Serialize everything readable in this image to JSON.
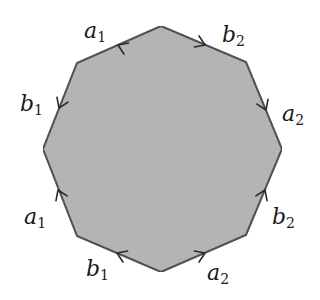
{
  "diagram": {
    "title": "",
    "type": "fundamental polygon (octagon)",
    "colors": {
      "fill": "#b4b4b4",
      "stroke": "#3a3a3a",
      "label": "#1a1a1a",
      "background": "#ffffff"
    },
    "vertices": [
      {
        "id": "top",
        "x": 161,
        "y": 26
      },
      {
        "id": "top-right",
        "x": 246,
        "y": 62
      },
      {
        "id": "right",
        "x": 282,
        "y": 149
      },
      {
        "id": "bottom-right",
        "x": 246,
        "y": 235
      },
      {
        "id": "bottom",
        "x": 161,
        "y": 272
      },
      {
        "id": "bottom-left",
        "x": 77,
        "y": 236
      },
      {
        "id": "left",
        "x": 43,
        "y": 149
      },
      {
        "id": "top-left",
        "x": 77,
        "y": 63
      }
    ],
    "edges": [
      {
        "name": "edge-top-left",
        "letter": "a",
        "sub": "1",
        "from": "top",
        "to": "top-left",
        "label_x": 84,
        "label_y": 38
      },
      {
        "name": "edge-top-right",
        "letter": "b",
        "sub": "2",
        "from": "top",
        "to": "top-right",
        "label_x": 222,
        "label_y": 40
      },
      {
        "name": "edge-right-upper",
        "letter": "a",
        "sub": "2",
        "from": "top-right",
        "to": "right",
        "label_x": 282,
        "label_y": 120
      },
      {
        "name": "edge-right-lower",
        "letter": "b",
        "sub": "2",
        "from": "bottom-right",
        "to": "right",
        "label_x": 272,
        "label_y": 227
      },
      {
        "name": "edge-bottom-right",
        "letter": "a",
        "sub": "2",
        "from": "bottom",
        "to": "bottom-right",
        "label_x": 206,
        "label_y": 282
      },
      {
        "name": "edge-bottom-left",
        "letter": "b",
        "sub": "1",
        "from": "bottom",
        "to": "bottom-left",
        "label_x": 87,
        "label_y": 278
      },
      {
        "name": "edge-left-lower",
        "letter": "a",
        "sub": "1",
        "from": "bottom-left",
        "to": "left",
        "label_x": 24,
        "label_y": 224
      },
      {
        "name": "edge-left-upper",
        "letter": "b",
        "sub": "1",
        "from": "top-left",
        "to": "left",
        "label_x": 20,
        "label_y": 113
      }
    ],
    "labels": {
      "a1_top": {
        "letter": "a",
        "sub": "1"
      },
      "b2_top": {
        "letter": "b",
        "sub": "2"
      },
      "a2_right": {
        "letter": "a",
        "sub": "2"
      },
      "b2_right": {
        "letter": "b",
        "sub": "2"
      },
      "a2_bottom": {
        "letter": "a",
        "sub": "2"
      },
      "b1_bottom": {
        "letter": "b",
        "sub": "1"
      },
      "a1_left": {
        "letter": "a",
        "sub": "1"
      },
      "b1_left": {
        "letter": "b",
        "sub": "1"
      }
    }
  }
}
